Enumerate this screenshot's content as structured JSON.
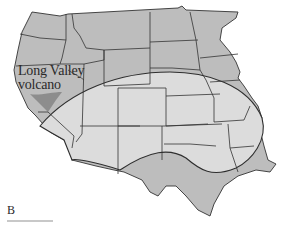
{
  "figure": {
    "panel_label": "B",
    "annotation": {
      "line1": "Long Valley",
      "line2": "volcano"
    },
    "caption_text_visible": false
  },
  "colors": {
    "state_fill_outside": "#bdbdbd",
    "state_fill_inside_zone": "#dcdcdc",
    "volcano_shading": "#8a8a8a",
    "state_border": "#333333",
    "zone_outline": "#2e2e2e",
    "background": "#ffffff"
  },
  "map": {
    "subject": "Western and central United States",
    "features": [
      "state-borders",
      "ash-fall-zone-outline",
      "long-valley-caldera-shading"
    ]
  }
}
